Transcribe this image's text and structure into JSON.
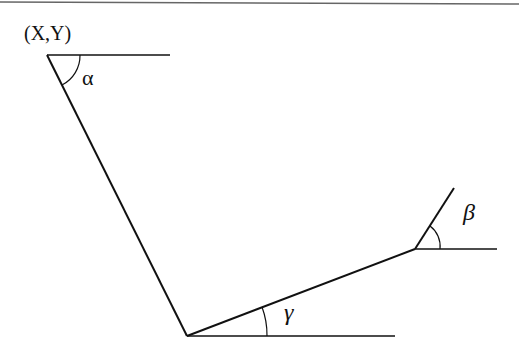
{
  "diagram": {
    "type": "kinematic-linkage",
    "point_label": "(X,Y)",
    "angles": [
      {
        "name": "alpha",
        "symbol": "α"
      },
      {
        "name": "beta",
        "symbol": "β"
      },
      {
        "name": "gamma",
        "symbol": "γ"
      }
    ],
    "colors": {
      "line": "#111111",
      "background": "#ffffff"
    }
  }
}
